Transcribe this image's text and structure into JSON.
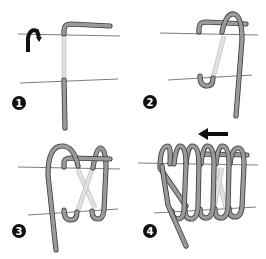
{
  "diagram": {
    "steps": [
      {
        "number": "1",
        "description": "Bend the wire end over the top line"
      },
      {
        "number": "2",
        "description": "Hook around the bottom line and loop over the top"
      },
      {
        "number": "3",
        "description": "Continue wrapping, crossing behind"
      },
      {
        "number": "4",
        "description": "Repeat coils, working in the direction of the arrow"
      }
    ],
    "colors": {
      "wire": "#9a9a9a",
      "wire_outline": "#3a3a3a",
      "wire_behind": "#e2e2e2",
      "guide_line": "#6e6e6e",
      "badge": "#111111"
    },
    "icons": {
      "rotate": "curved-arrow-down-icon",
      "direction": "arrow-left-icon"
    }
  }
}
